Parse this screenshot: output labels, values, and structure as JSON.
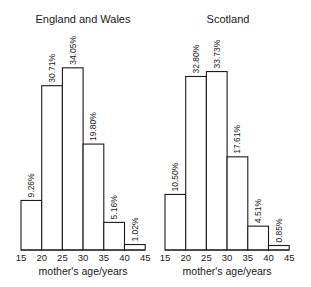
{
  "chart_data": [
    {
      "type": "bar",
      "title": "England and Wales",
      "xlabel": "mother's age/years",
      "ylabel": "",
      "bin_edges": [
        15,
        20,
        25,
        30,
        35,
        40,
        45
      ],
      "tick_labels": [
        "15",
        "20",
        "25",
        "30",
        "35",
        "40",
        "45"
      ],
      "categories": [
        "15-20",
        "20-25",
        "25-30",
        "30-35",
        "35-40",
        "40-45"
      ],
      "values": [
        9.26,
        30.71,
        34.05,
        19.8,
        5.16,
        1.02
      ],
      "value_labels": [
        "9.26%",
        "30.71%",
        "34.05%",
        "19.80%",
        "5.16%",
        "1.02%"
      ],
      "grid": false,
      "legend": null
    },
    {
      "type": "bar",
      "title": "Scotland",
      "xlabel": "mother's age/years",
      "ylabel": "",
      "bin_edges": [
        15,
        20,
        25,
        30,
        35,
        40,
        45
      ],
      "tick_labels": [
        "15",
        "20",
        "25",
        "30",
        "35",
        "40",
        "45"
      ],
      "categories": [
        "15-20",
        "20-25",
        "25-30",
        "30-35",
        "35-40",
        "40-45"
      ],
      "values": [
        10.5,
        32.8,
        33.73,
        17.61,
        4.51,
        0.85
      ],
      "value_labels": [
        "10.50%",
        "32.80%",
        "33.73%",
        "17.61%",
        "4.51%",
        "0.85%"
      ],
      "grid": false,
      "legend": null
    }
  ],
  "colors": {
    "ink": "#1a1a1a",
    "background": "#ffffff"
  }
}
